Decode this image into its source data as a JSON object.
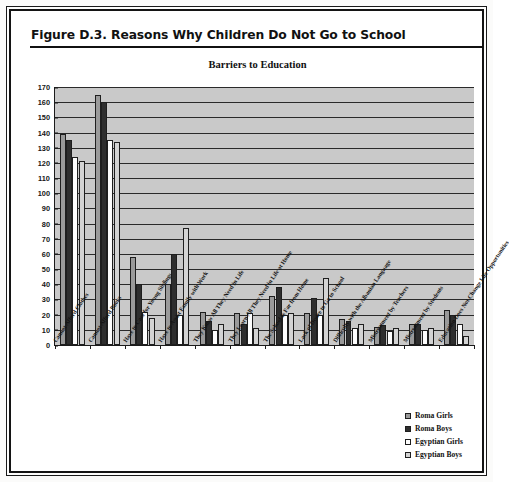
{
  "figure": {
    "caption": "Figure D.3.  Reasons Why Children Do Not Go to School"
  },
  "chart_data": {
    "type": "bar",
    "title": "Barriers to Education",
    "xlabel": "",
    "ylabel": "",
    "ylim": [
      0,
      170
    ],
    "ytick_step": 10,
    "grid": true,
    "legend_position": "bottom-right",
    "orientation": "vertical-grouped",
    "ytick_labels": [
      "170",
      "160",
      "150",
      "140",
      "130",
      "120",
      "110",
      "100",
      "90",
      "80",
      "70",
      "60",
      "50",
      "40",
      "30",
      "20",
      "10",
      "0"
    ],
    "categories": [
      "Cannot Afford Clothes",
      "Cannot Afford Books",
      "Have to Care for Young Siblings",
      "Have to Assist Family with Work",
      "They Know All They Need in Life",
      "They Learn All They Need in Life at Home",
      "The School Is Far from Home",
      "Lack of Desire to Go to School",
      "Difficulty with the Albanian Language",
      "Mistreatment by Teachers",
      "Mistreatment by Students",
      "Education Does Not Change Life Opportunities"
    ],
    "series": [
      {
        "name": "Roma Girls",
        "color": "#9a9a9a",
        "values": [
          139,
          165,
          58,
          40,
          22,
          21,
          32,
          21,
          17,
          12,
          14,
          23
        ]
      },
      {
        "name": "Roma Boys",
        "color": "#2e2e2e",
        "values": [
          135,
          160,
          40,
          60,
          16,
          14,
          38,
          31,
          16,
          13,
          14,
          20
        ]
      },
      {
        "name": "Egyptian Girls",
        "color": "#fdfdfd",
        "values": [
          124,
          135,
          22,
          20,
          10,
          21,
          20,
          20,
          11,
          9,
          10,
          14
        ]
      },
      {
        "name": "Egyptian Boys",
        "color": "#d3d3d3",
        "values": [
          121,
          134,
          18,
          77,
          14,
          11,
          21,
          44,
          14,
          11,
          11,
          6
        ]
      }
    ]
  },
  "legend": {
    "items": [
      {
        "label": "Roma Girls",
        "color": "#9a9a9a"
      },
      {
        "label": "Roma Boys",
        "color": "#2e2e2e"
      },
      {
        "label": "Egyptian Girls",
        "color": "#fdfdfd"
      },
      {
        "label": "Egyptian Boys",
        "color": "#d3d3d3"
      }
    ]
  }
}
